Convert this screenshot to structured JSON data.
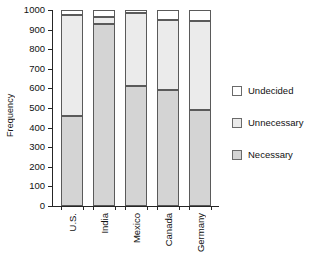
{
  "chart_data": {
    "type": "bar",
    "subtype": "stacked-bar",
    "title": "",
    "xlabel": "",
    "ylabel": "Frequency",
    "categories": [
      "U.S.",
      "India",
      "Mexico",
      "Canada",
      "Germany"
    ],
    "series": [
      {
        "name": "Necessary",
        "color": "#d4d4d4",
        "values": [
          460,
          930,
          610,
          590,
          490
        ]
      },
      {
        "name": "Unnecessary",
        "color": "#ebebeb",
        "values": [
          515,
          35,
          375,
          360,
          455
        ]
      },
      {
        "name": "Undecided",
        "color": "#ffffff",
        "values": [
          25,
          35,
          15,
          50,
          55
        ]
      }
    ],
    "stack_order_bottom_to_top": [
      "Necessary",
      "Unnecessary",
      "Undecided"
    ],
    "cumulative_tops": [
      {
        "category": "U.S.",
        "necessary_top": 460,
        "unnecessary_top": 975,
        "total": 1000
      },
      {
        "category": "India",
        "necessary_top": 930,
        "unnecessary_top": 965,
        "total": 1000
      },
      {
        "category": "Mexico",
        "necessary_top": 610,
        "unnecessary_top": 985,
        "total": 1000
      },
      {
        "category": "Canada",
        "necessary_top": 590,
        "unnecessary_top": 950,
        "total": 1000
      },
      {
        "category": "Germany",
        "necessary_top": 490,
        "unnecessary_top": 945,
        "total": 1000
      }
    ],
    "ylim": [
      0,
      1000
    ],
    "ytick_values": [
      0,
      100,
      200,
      300,
      400,
      500,
      600,
      700,
      800,
      900,
      1000
    ],
    "ytick_labels": [
      "0",
      "100",
      "200",
      "300",
      "400",
      "500",
      "600",
      "700",
      "800",
      "900",
      "1000"
    ],
    "grid": false,
    "legend_position": "right",
    "legend_entries": [
      "Undecided",
      "Unnecessary",
      "Necessary"
    ],
    "axis_color": "#262626",
    "bar_edge_color": "#5a5a5a",
    "background_color": "#ffffff"
  },
  "axes": {
    "y_label": "Frequency"
  },
  "legend": {
    "items": [
      {
        "label": "Undecided",
        "color": "#ffffff"
      },
      {
        "label": "Unnecessary",
        "color": "#ebebeb"
      },
      {
        "label": "Necessary",
        "color": "#d4d4d4"
      }
    ]
  }
}
